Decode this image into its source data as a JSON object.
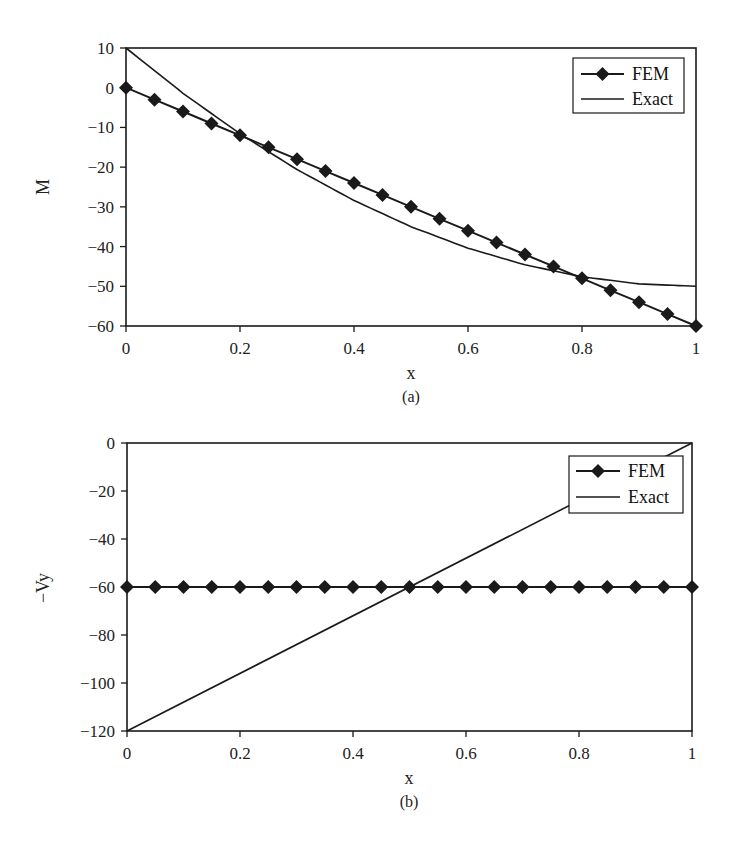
{
  "chart_data": [
    {
      "type": "line",
      "panel": "(a)",
      "title": "",
      "xlabel": "x",
      "ylabel": "M",
      "xlim": [
        0,
        1
      ],
      "ylim": [
        -60,
        10
      ],
      "x_ticks": [
        "0",
        "0.2",
        "0.4",
        "0.6",
        "0.8",
        "1"
      ],
      "y_ticks": [
        "10",
        "0",
        "−10",
        "−20",
        "−30",
        "−40",
        "−50",
        "−60"
      ],
      "grid": false,
      "legend_position": "upper right",
      "series": [
        {
          "name": "FEM",
          "marker": "diamond",
          "x": [
            0,
            0.05,
            0.1,
            0.15,
            0.2,
            0.25,
            0.3,
            0.35,
            0.4,
            0.45,
            0.5,
            0.55,
            0.6,
            0.65,
            0.7,
            0.75,
            0.8,
            0.85,
            0.9,
            0.95,
            1.0
          ],
          "values": [
            0,
            -3,
            -6,
            -9,
            -12,
            -15,
            -18,
            -21,
            -24,
            -27,
            -30,
            -33,
            -36,
            -39,
            -42,
            -45,
            -48,
            -51,
            -54,
            -57,
            -60
          ]
        },
        {
          "name": "Exact",
          "marker": "none",
          "x": [
            0,
            0.1,
            0.2,
            0.3,
            0.4,
            0.5,
            0.6,
            0.7,
            0.8,
            0.9,
            1.0
          ],
          "values": [
            10,
            -1.4,
            -11.6,
            -20.6,
            -28.4,
            -35,
            -40.4,
            -44.6,
            -47.6,
            -49.4,
            -50
          ]
        }
      ]
    },
    {
      "type": "line",
      "panel": "(b)",
      "title": "",
      "xlabel": "x",
      "ylabel": "−Vy",
      "xlim": [
        0,
        1
      ],
      "ylim": [
        -120,
        0
      ],
      "x_ticks": [
        "0",
        "0.2",
        "0.4",
        "0.6",
        "0.8",
        "1"
      ],
      "y_ticks": [
        "0",
        "−20",
        "−40",
        "−60",
        "−80",
        "−100",
        "−120"
      ],
      "grid": false,
      "legend_position": "upper right",
      "series": [
        {
          "name": "FEM",
          "marker": "diamond",
          "x": [
            0,
            0.05,
            0.1,
            0.15,
            0.2,
            0.25,
            0.3,
            0.35,
            0.4,
            0.45,
            0.5,
            0.55,
            0.6,
            0.65,
            0.7,
            0.75,
            0.8,
            0.85,
            0.9,
            0.95,
            1.0
          ],
          "values": [
            -60,
            -60,
            -60,
            -60,
            -60,
            -60,
            -60,
            -60,
            -60,
            -60,
            -60,
            -60,
            -60,
            -60,
            -60,
            -60,
            -60,
            -60,
            -60,
            -60,
            -60
          ]
        },
        {
          "name": "Exact",
          "marker": "none",
          "x": [
            0,
            1
          ],
          "values": [
            -120,
            0
          ]
        }
      ]
    }
  ],
  "panels": {
    "a": {
      "caption": "(a)",
      "xlabel": "x",
      "ylabel": "M",
      "legend": [
        "FEM",
        "Exact"
      ]
    },
    "b": {
      "caption": "(b)",
      "xlabel": "x",
      "ylabel": "−Vy",
      "legend": [
        "FEM",
        "Exact"
      ]
    }
  },
  "style": {
    "line_color": "#1a1a1a",
    "background": "#ffffff"
  }
}
